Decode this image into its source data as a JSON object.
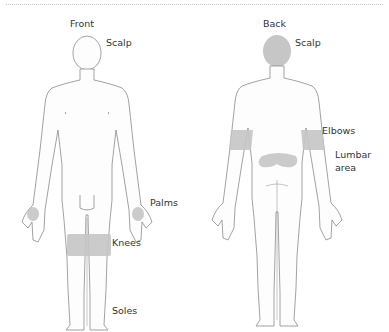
{
  "diagram": {
    "colors": {
      "outline": "#8a8a8a",
      "shade": "#c6c6c6",
      "text": "#333333"
    },
    "front": {
      "title": "Front",
      "labels": {
        "scalp": "Scalp",
        "palms": "Palms",
        "knees": "Knees",
        "soles": "Soles"
      }
    },
    "back": {
      "title": "Back",
      "labels": {
        "scalp": "Scalp",
        "elbows": "Elbows",
        "lumbar_line1": "Lumbar",
        "lumbar_line2": "area"
      }
    }
  }
}
